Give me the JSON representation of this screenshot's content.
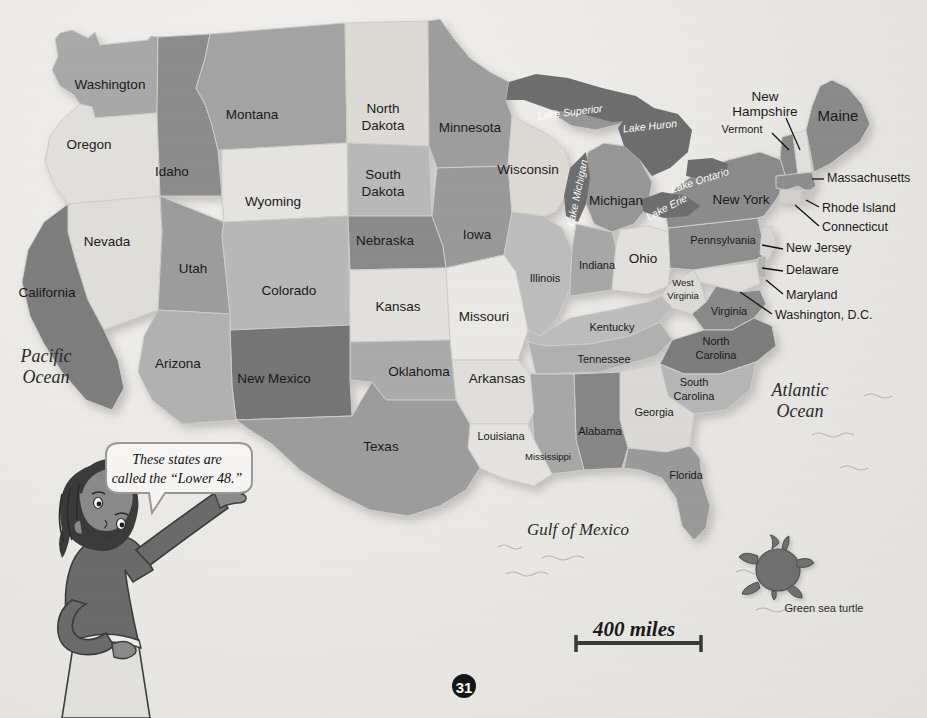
{
  "page": {
    "number": "31",
    "background_color": "#e9e7e4"
  },
  "map": {
    "title_hidden": "",
    "scale_bar": {
      "label": "400 miles"
    },
    "speech_bubble": {
      "text_line1": "These states are",
      "text_line2": "called the “Lower 48.”"
    },
    "turtle_caption": "Green sea turtle",
    "oceans": [
      {
        "name": "Pacific Ocean",
        "line1": "Pacific",
        "line2": "Ocean",
        "x": 46,
        "y": 366
      },
      {
        "name": "Atlantic Ocean",
        "line1": "Atlantic",
        "line2": "Ocean",
        "x": 800,
        "y": 400
      },
      {
        "name": "Gulf of Mexico",
        "line1": "Gulf of Mexico",
        "line2": "",
        "x": 578,
        "y": 531
      }
    ],
    "lakes": [
      {
        "label": "Lake Superior",
        "x": 570,
        "y": 113,
        "rotate": -7
      },
      {
        "label": "Lake Huron",
        "x": 650,
        "y": 127,
        "rotate": -6
      },
      {
        "label": "Lake Michigan",
        "x": 578,
        "y": 193,
        "rotate": -78
      },
      {
        "label": "Lake Ontario",
        "x": 700,
        "y": 181,
        "rotate": -18
      },
      {
        "label": "Lake Erie",
        "x": 667,
        "y": 208,
        "rotate": -27
      }
    ],
    "states_inline": [
      {
        "name": "Washington",
        "label": "Washington",
        "x": 110,
        "y": 85,
        "size": "md",
        "fill": "#a9a9a9"
      },
      {
        "name": "Oregon",
        "label": "Oregon",
        "x": 89,
        "y": 145,
        "size": "md",
        "fill": "#e2e0dc"
      },
      {
        "name": "Idaho",
        "label": "Idaho",
        "x": 172,
        "y": 172,
        "size": "md",
        "fill": "#8d8d8d"
      },
      {
        "name": "Montana",
        "label": "Montana",
        "x": 252,
        "y": 115,
        "size": "md",
        "fill": "#a4a4a4"
      },
      {
        "name": "North Dakota",
        "label": "North Dakota",
        "line1": "North",
        "line2": "Dakota",
        "x": 383,
        "y": 117,
        "size": "md",
        "fill": "#dedbd7"
      },
      {
        "name": "South Dakota",
        "label": "South Dakota",
        "line1": "South",
        "line2": "Dakota",
        "x": 383,
        "y": 183,
        "size": "md",
        "fill": "#b9b9b9"
      },
      {
        "name": "Minnesota",
        "label": "Minnesota",
        "x": 470,
        "y": 128,
        "size": "md",
        "fill": "#9e9e9e"
      },
      {
        "name": "Wisconsin",
        "label": "Wisconsin",
        "x": 528,
        "y": 170,
        "size": "md",
        "fill": "#dedbd7"
      },
      {
        "name": "Michigan",
        "label": "Michigan",
        "x": 616,
        "y": 201,
        "size": "md",
        "fill": "#979797"
      },
      {
        "name": "Wyoming",
        "label": "Wyoming",
        "x": 273,
        "y": 202,
        "size": "md",
        "fill": "#e6e4e0"
      },
      {
        "name": "Nevada",
        "label": "Nevada",
        "x": 107,
        "y": 242,
        "size": "md",
        "fill": "#e0dedb"
      },
      {
        "name": "Utah",
        "label": "Utah",
        "x": 193,
        "y": 269,
        "size": "md",
        "fill": "#9d9d9d"
      },
      {
        "name": "Colorado",
        "label": "Colorado",
        "x": 289,
        "y": 291,
        "size": "md",
        "fill": "#b8b8b8"
      },
      {
        "name": "Nebraska",
        "label": "Nebraska",
        "x": 385,
        "y": 241,
        "size": "md",
        "fill": "#8b8b8b"
      },
      {
        "name": "Iowa",
        "label": "Iowa",
        "x": 477,
        "y": 235,
        "size": "md",
        "fill": "#9a9a9a"
      },
      {
        "name": "Kansas",
        "label": "Kansas",
        "x": 398,
        "y": 307,
        "size": "md",
        "fill": "#e3e1dd"
      },
      {
        "name": "Missouri",
        "label": "Missouri",
        "x": 484,
        "y": 317,
        "size": "md",
        "fill": "#ebe9e6"
      },
      {
        "name": "Illinois",
        "label": "Illinois",
        "x": 545,
        "y": 279,
        "size": "md",
        "fill": "#bdbdbd"
      },
      {
        "name": "Indiana",
        "label": "Indiana",
        "x": 597,
        "y": 266,
        "size": "md",
        "fill": "#a8a8a8"
      },
      {
        "name": "Ohio",
        "label": "Ohio",
        "x": 643,
        "y": 259,
        "size": "md",
        "fill": "#e3e1dd"
      },
      {
        "name": "California",
        "label": "California",
        "x": 47,
        "y": 293,
        "size": "md",
        "fill": "#7e7e7e"
      },
      {
        "name": "Arizona",
        "label": "Arizona",
        "x": 178,
        "y": 364,
        "size": "md",
        "fill": "#b2b2b2"
      },
      {
        "name": "New Mexico",
        "label": "New Mexico",
        "x": 274,
        "y": 379,
        "size": "md",
        "fill": "#767676"
      },
      {
        "name": "Oklahoma",
        "label": "Oklahoma",
        "x": 419,
        "y": 372,
        "size": "md",
        "fill": "#ababab"
      },
      {
        "name": "Texas",
        "label": "Texas",
        "x": 381,
        "y": 447,
        "size": "md",
        "fill": "#9d9d9d"
      },
      {
        "name": "Arkansas",
        "label": "Arkansas",
        "x": 497,
        "y": 379,
        "size": "md",
        "fill": "#e0dedb"
      },
      {
        "name": "Louisiana",
        "label": "Louisiana",
        "x": 501,
        "y": 437,
        "size": "sm",
        "fill": "#e5e3df"
      },
      {
        "name": "Mississippi",
        "label": "Mississippi",
        "x": 548,
        "y": 457,
        "size": "xs",
        "fill": "#a8a8a8"
      },
      {
        "name": "Alabama",
        "label": "Alabama",
        "x": 600,
        "y": 432,
        "size": "md",
        "fill": "#878787"
      },
      {
        "name": "Tennessee",
        "label": "Tennessee",
        "x": 604,
        "y": 360,
        "size": "md",
        "fill": "#b1b1b1"
      },
      {
        "name": "Kentucky",
        "label": "Kentucky",
        "x": 612,
        "y": 328,
        "size": "md",
        "fill": "#bdbdbd"
      },
      {
        "name": "West Virginia",
        "label": "West Virginia",
        "line1": "West",
        "line2": "Virginia",
        "x": 683,
        "y": 289,
        "size": "sm",
        "fill": "#dddbd7"
      },
      {
        "name": "Virginia",
        "label": "Virginia",
        "x": 729,
        "y": 312,
        "size": "md",
        "fill": "#8a8a8a"
      },
      {
        "name": "North Carolina",
        "label": "North Carolina",
        "line1": "North",
        "line2": "Carolina",
        "x": 716,
        "y": 349,
        "size": "sm",
        "fill": "#7d7d7d"
      },
      {
        "name": "South Carolina",
        "label": "South Carolina",
        "line1": "South",
        "line2": "Carolina",
        "x": 694,
        "y": 390,
        "size": "sm",
        "fill": "#b6b6b6"
      },
      {
        "name": "Georgia",
        "label": "Georgia",
        "x": 654,
        "y": 413,
        "size": "md",
        "fill": "#dcdad6"
      },
      {
        "name": "Florida",
        "label": "Florida",
        "x": 686,
        "y": 476,
        "size": "md",
        "fill": "#9a9a9a"
      },
      {
        "name": "Pennsylvania",
        "label": "Pennsylvania",
        "x": 723,
        "y": 241,
        "size": "md",
        "fill": "#8f8f8f"
      },
      {
        "name": "New York",
        "label": "New York",
        "x": 741,
        "y": 200,
        "size": "md",
        "fill": "#8c8c8c"
      },
      {
        "name": "Maine",
        "label": "Maine",
        "x": 838,
        "y": 117,
        "size": "lg",
        "fill": "#8b8b8b"
      }
    ],
    "states_leadered": [
      {
        "name": "New Hampshire",
        "line1": "New",
        "line2": "Hampshire",
        "x": 765,
        "y": 97,
        "anchor": "middle",
        "leader": "M 786,118 L 800,150"
      },
      {
        "name": "Vermont",
        "line1": "Vermont",
        "line2": "",
        "x": 742,
        "y": 130,
        "anchor": "middle",
        "leader": "M 772,133 L 789,150"
      },
      {
        "name": "Massachusetts",
        "line1": "Massachusetts",
        "line2": "",
        "x": 827,
        "y": 179,
        "anchor": "start",
        "leader": "M 824,179 L 812,179"
      },
      {
        "name": "Rhode Island",
        "line1": "Rhode Island",
        "line2": "",
        "x": 822,
        "y": 209,
        "anchor": "start",
        "leader": "M 819,207 L 806,200"
      },
      {
        "name": "Connecticut",
        "line1": "Connecticut",
        "line2": "",
        "x": 822,
        "y": 228,
        "anchor": "start",
        "leader": "M 819,226 L 795,205"
      },
      {
        "name": "New Jersey",
        "line1": "New Jersey",
        "line2": "",
        "x": 786,
        "y": 249,
        "anchor": "start",
        "leader": "M 783,249 L 765,245"
      },
      {
        "name": "Delaware",
        "line1": "Delaware",
        "line2": "",
        "x": 786,
        "y": 271,
        "anchor": "start",
        "leader": "M 783,271 L 765,268"
      },
      {
        "name": "Maryland",
        "line1": "Maryland",
        "line2": "",
        "x": 786,
        "y": 296,
        "anchor": "start",
        "leader": "M 783,294 L 768,282"
      },
      {
        "name": "Washington, D.C.",
        "line1": "Washington, D.C.",
        "line2": "",
        "x": 775,
        "y": 316,
        "anchor": "start",
        "leader": "M 772,314 L 743,293"
      }
    ]
  }
}
